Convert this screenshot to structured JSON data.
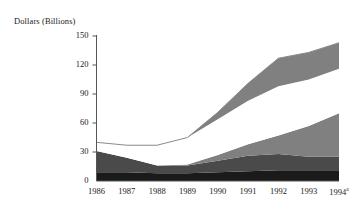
{
  "chart_data": {
    "type": "area",
    "title": "",
    "subtitle": "",
    "ylabel": "Dollars (Billions)",
    "xlabel": "",
    "categories": [
      "1986",
      "1987",
      "1988",
      "1989",
      "1990",
      "1991",
      "1992",
      "1993",
      "1994"
    ],
    "x_tick_labels": [
      "1986",
      "1987",
      "1988",
      "1989",
      "1990",
      "1991",
      "1992",
      "1993",
      "1994"
    ],
    "x_tick_superscripts": [
      "",
      "",
      "",
      "",
      "",
      "",
      "",
      "",
      "a"
    ],
    "y_ticks": [
      0,
      30,
      60,
      90,
      120,
      150
    ],
    "ylim": [
      0,
      150
    ],
    "grid": false,
    "legend_position": "none",
    "stacked": true,
    "series": [
      {
        "name": "band-1",
        "color": "#1a1a1a",
        "values": [
          9,
          9,
          8,
          8,
          9,
          10,
          11,
          11,
          11
        ]
      },
      {
        "name": "band-2",
        "color": "#4a4a4a",
        "values": [
          22,
          15,
          8,
          8,
          12,
          16,
          17,
          14,
          14
        ]
      },
      {
        "name": "band-3",
        "color": "#808080",
        "values": [
          0,
          0,
          0,
          1,
          6,
          12,
          19,
          32,
          45
        ]
      },
      {
        "name": "band-4",
        "color": "#ffffff",
        "values": [
          9,
          13,
          21,
          28,
          37,
          45,
          51,
          48,
          46
        ]
      },
      {
        "name": "band-5",
        "color": "#808080",
        "values": [
          0,
          0,
          0,
          0,
          7,
          18,
          29,
          28,
          27
        ]
      }
    ],
    "totals": [
      40,
      37,
      37,
      45,
      71,
      101,
      127,
      133,
      143
    ]
  },
  "caption": {
    "text": ""
  },
  "colors": {
    "axis": "#555555",
    "band_black": "#1a1a1a",
    "band_dark_gray": "#4a4a4a",
    "band_gray": "#808080",
    "band_white": "#ffffff",
    "outline": "#8a8a8a",
    "text": "#1a1a1a"
  }
}
